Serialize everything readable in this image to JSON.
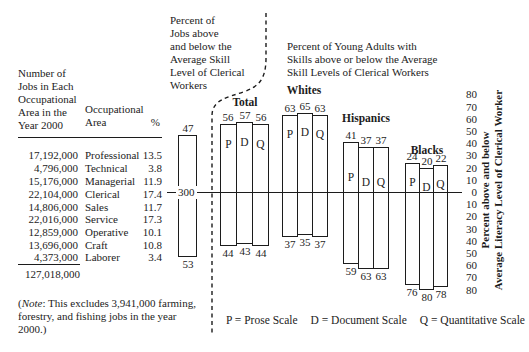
{
  "table": {
    "col1_header": "Number of\nJobs in Each\nOccupational\nArea in the\nYear 2000",
    "col2_header": "Occupational\nArea",
    "col3_header": "%",
    "rows": [
      {
        "jobs": "17,192,000",
        "area": "Professional",
        "pct": "13.5"
      },
      {
        "jobs": "4,796,000",
        "area": "Technical",
        "pct": "3.8"
      },
      {
        "jobs": "15,176,000",
        "area": "Managerial",
        "pct": "11.9"
      },
      {
        "jobs": "22,104,000",
        "area": "Clerical",
        "pct": "17.4"
      },
      {
        "jobs": "14,806,000",
        "area": "Sales",
        "pct": "11.7"
      },
      {
        "jobs": "22,016,000",
        "area": "Service",
        "pct": "17.3"
      },
      {
        "jobs": "12,859,000",
        "area": "Operative",
        "pct": "10.1"
      },
      {
        "jobs": "13,696,000",
        "area": "Craft",
        "pct": "10.8"
      },
      {
        "jobs": "4,373,000",
        "area": "Laborer",
        "pct": "3.4"
      }
    ],
    "total": "127,018,000"
  },
  "note": {
    "open": "(",
    "italic": "Note",
    "rest": ": This excludes 3,941,000 farming, forestry, and fishing jobs in the year 2000.)"
  },
  "left_chart_title": "Percent of\nJobs above\nand below the\nAverage Skill\nLevel of Clerical\nWorkers",
  "right_chart_title": "Percent of Young Adults with\nSkills above or below the Average\nSkill Levels of Clerical Workers",
  "legend": {
    "items": [
      "P = Prose Scale",
      "D = Document Scale",
      "Q = Quantitative Scale"
    ]
  },
  "chart_data": {
    "type": "bar",
    "subtype": "diverging",
    "unit": "percent above / below average clerical skill level",
    "scales": [
      "P",
      "D",
      "Q"
    ],
    "reference_line": {
      "label": "300",
      "aligned_row": "Clerical 17.4"
    },
    "jobs_bar": {
      "title_ref": "Percent of Jobs",
      "above": 47,
      "below": 53
    },
    "groups": [
      {
        "name": "Total",
        "above": [
          56,
          57,
          56
        ],
        "below": [
          44,
          43,
          44
        ]
      },
      {
        "name": "Whites",
        "above": [
          63,
          65,
          63
        ],
        "below": [
          37,
          35,
          37
        ]
      },
      {
        "name": "Hispanics",
        "above": [
          41,
          37,
          37
        ],
        "below": [
          59,
          63,
          63
        ]
      },
      {
        "name": "Blacks",
        "above": [
          24,
          20,
          22
        ],
        "below": [
          76,
          80,
          78
        ]
      }
    ],
    "y_axis": {
      "ticks": [
        80,
        70,
        60,
        50,
        40,
        30,
        20,
        10,
        0,
        10,
        20,
        30,
        40,
        50,
        60,
        70,
        80
      ],
      "max_above": 80,
      "max_below": 80,
      "label": "Percent above and below\nAverage Literacy Level of Clerical Worker",
      "position": "right"
    }
  }
}
